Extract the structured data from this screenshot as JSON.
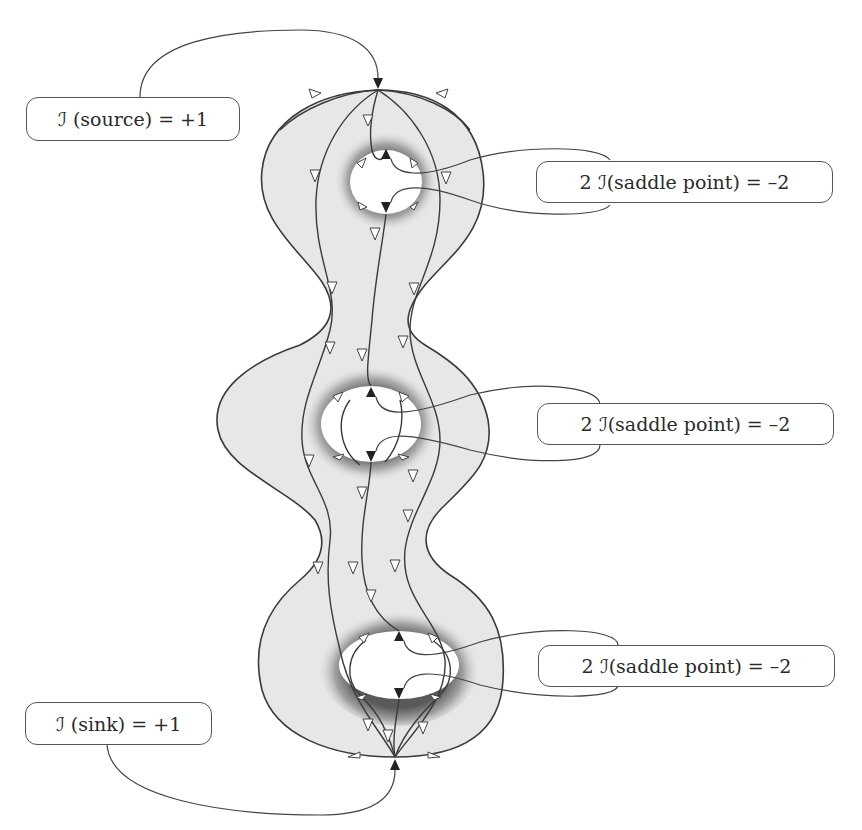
{
  "figure": {
    "type": "vector-field-on-surface",
    "colors": {
      "surface_fill": "#e7e7e7",
      "hole_shadow": "#8a8a8a",
      "stroke": "#3a3a3a",
      "label_border": "#555555",
      "text": "#2b2b2b"
    }
  },
  "labels": {
    "source": "ℐ (source) = +1",
    "saddle_top": "2 ℐ(saddle point) = –2",
    "saddle_middle": "2 ℐ(saddle point) = –2",
    "saddle_bottom": "2 ℐ(saddle point) = –2",
    "sink": "ℐ (sink) = +1"
  },
  "singularities": [
    {
      "kind": "source",
      "index": "+1",
      "x": 378,
      "y": 90
    },
    {
      "kind": "saddle",
      "hole": 1,
      "count": 2,
      "index": "-2"
    },
    {
      "kind": "saddle",
      "hole": 2,
      "count": 2,
      "index": "-2"
    },
    {
      "kind": "saddle",
      "hole": 3,
      "count": 2,
      "index": "-2"
    },
    {
      "kind": "sink",
      "index": "+1",
      "x": 395,
      "y": 757
    }
  ]
}
